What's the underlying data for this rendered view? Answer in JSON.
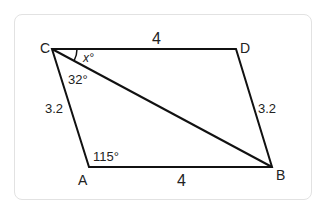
{
  "figure": {
    "type": "parallelogram",
    "vertices": {
      "A": {
        "label": "A",
        "x": 89,
        "y": 167
      },
      "B": {
        "label": "B",
        "x": 272,
        "y": 167
      },
      "C": {
        "label": "C",
        "x": 52,
        "y": 49
      },
      "D": {
        "label": "D",
        "x": 236,
        "y": 49
      }
    },
    "sides": {
      "CD": "4",
      "AB": "4",
      "CA": "3.2",
      "DB": "3.2"
    },
    "angles": {
      "DCB": "x°",
      "BCA": "32°",
      "CAB": "115°"
    },
    "diagonal": "CB"
  }
}
